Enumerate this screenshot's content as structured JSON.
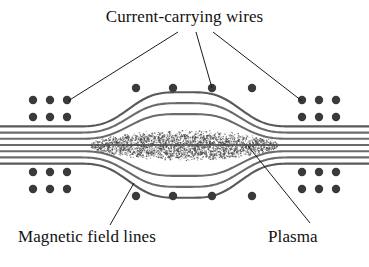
{
  "figure": {
    "title": "Current-carrying wires",
    "background_color": "#ffffff",
    "width": 369,
    "height": 267
  },
  "labels": {
    "wires": "Current-carrying wires",
    "field_lines": "Magnetic field lines",
    "plasma": "Plasma"
  },
  "colors": {
    "text": "#111111",
    "field_line": "#6b6b6b",
    "field_line_dark": "#595959",
    "wire_dot": "#3a3a3a",
    "leader_line": "#1a1a1a",
    "plasma_stipple": "#4a4a4a"
  },
  "diagram": {
    "type": "physics-schematic",
    "field_line_count": 7,
    "plasma_shape": "lens",
    "plasma_center_x": 184,
    "plasma_center_y": 145,
    "plasma_half_width": 95,
    "plasma_half_height": 16,
    "wire_dot_radius": 4.2,
    "wire_clusters": [
      {
        "name": "left-upper",
        "columns_x": [
          33,
          50,
          67
        ],
        "rows_y": [
          100,
          117
        ]
      },
      {
        "name": "left-lower",
        "columns_x": [
          33,
          50,
          67
        ],
        "rows_y": [
          172,
          189
        ]
      },
      {
        "name": "right-upper",
        "columns_x": [
          302,
          319,
          336
        ],
        "rows_y": [
          100,
          117
        ]
      },
      {
        "name": "right-lower",
        "columns_x": [
          302,
          319,
          336
        ],
        "rows_y": [
          172,
          189
        ]
      }
    ],
    "center_dot_rows": [
      {
        "name": "upper-center-row",
        "y": 88,
        "x": [
          136,
          173,
          212,
          252
        ]
      },
      {
        "name": "lower-center-row",
        "y": 196,
        "x": [
          136,
          173,
          212,
          252
        ]
      }
    ],
    "leader_lines": [
      {
        "name": "wires-leader-left",
        "x1": 178,
        "y1": 32,
        "x2": 68,
        "y2": 101
      },
      {
        "name": "wires-leader-center",
        "x1": 196,
        "y1": 32,
        "x2": 212,
        "y2": 88
      },
      {
        "name": "wires-leader-right",
        "x1": 213,
        "y1": 32,
        "x2": 302,
        "y2": 101
      },
      {
        "name": "field-lines-leader",
        "x1": 110,
        "y1": 225,
        "x2": 134,
        "y2": 183
      },
      {
        "name": "plasma-leader",
        "x1": 310,
        "y1": 223,
        "x2": 248,
        "y2": 146
      }
    ]
  }
}
